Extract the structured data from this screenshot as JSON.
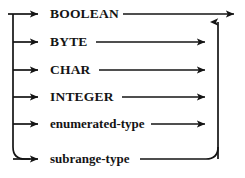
{
  "diagram": {
    "kind": "railroad-syntax-diagram",
    "stroke_color": "#141414",
    "text_color": "#141414",
    "background_color": "#ffffff",
    "width": 245,
    "height": 178,
    "entry_x": 8,
    "trunk_x": 13,
    "return_bus_x": 218,
    "exit_arrow_x": 242,
    "branches": [
      {
        "label": "BOOLEAN",
        "style": "keyword",
        "y": 14,
        "label_x": 50,
        "label_y": 14,
        "arrow_tip_x": 45,
        "line_start_x": 123,
        "line_end_x": 238,
        "continues_to_exit": true
      },
      {
        "label": "BYTE",
        "style": "keyword",
        "y": 42,
        "label_x": 50,
        "label_y": 42,
        "arrow_tip_x": 45,
        "line_start_x": 96,
        "line_end_x": 212,
        "continues_to_exit": false
      },
      {
        "label": "CHAR",
        "style": "keyword",
        "y": 70,
        "label_x": 50,
        "label_y": 70,
        "arrow_tip_x": 45,
        "line_start_x": 99,
        "line_end_x": 212,
        "continues_to_exit": false
      },
      {
        "label": "INTEGER",
        "style": "keyword",
        "y": 97,
        "label_x": 50,
        "label_y": 97,
        "arrow_tip_x": 45,
        "line_start_x": 122,
        "line_end_x": 212,
        "continues_to_exit": false
      },
      {
        "label": "enumerated-type",
        "style": "nonterminal",
        "y": 124,
        "label_x": 50,
        "label_y": 124,
        "arrow_tip_x": 45,
        "line_start_x": 151,
        "line_end_x": 212,
        "continues_to_exit": false
      },
      {
        "label": "subrange-type",
        "style": "nonterminal",
        "y": 159,
        "label_x": 50,
        "label_y": 159,
        "arrow_tip_x": 45,
        "line_start_x": 140,
        "line_end_x": 205,
        "continues_to_exit": false
      }
    ],
    "corners": {
      "bottom_left_radius": 12,
      "bottom_right_radius": 12
    },
    "arrowheads": [
      {
        "name": "branch-arrow-boolean",
        "x": 45,
        "y": 14,
        "direction": "right"
      },
      {
        "name": "branch-arrow-byte",
        "x": 45,
        "y": 42,
        "direction": "right"
      },
      {
        "name": "branch-arrow-char",
        "x": 45,
        "y": 70,
        "direction": "right"
      },
      {
        "name": "branch-arrow-integer",
        "x": 45,
        "y": 97,
        "direction": "right"
      },
      {
        "name": "branch-arrow-enumerated-type",
        "x": 45,
        "y": 124,
        "direction": "right"
      },
      {
        "name": "branch-arrow-subrange-type",
        "x": 45,
        "y": 159,
        "direction": "right"
      },
      {
        "name": "merge-arrow-byte",
        "x": 212,
        "y": 42,
        "direction": "right"
      },
      {
        "name": "merge-arrow-char",
        "x": 212,
        "y": 70,
        "direction": "right"
      },
      {
        "name": "merge-arrow-integer",
        "x": 212,
        "y": 97,
        "direction": "right"
      },
      {
        "name": "merge-arrow-enumerated-type",
        "x": 212,
        "y": 124,
        "direction": "right"
      },
      {
        "name": "return-bus-arrow",
        "x": 218,
        "y": 18,
        "direction": "up"
      },
      {
        "name": "exit-arrow",
        "x": 242,
        "y": 14,
        "direction": "right"
      }
    ]
  }
}
